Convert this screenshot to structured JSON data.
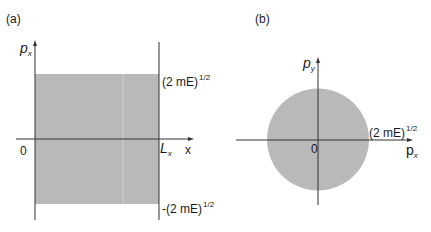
{
  "panel_a": {
    "label": "(a)",
    "y_axis": {
      "symbol": "p",
      "subscript": "x"
    },
    "x_axis": {
      "symbol": "x"
    },
    "origin": "0",
    "right_boundary": {
      "symbol": "L",
      "subscript": "x"
    },
    "upper_limit": {
      "text": "(2 mE)",
      "exponent": "1/2"
    },
    "lower_limit": {
      "text": "-(2 mE)",
      "exponent": "1/2"
    },
    "fill_color": "#b9b9b9",
    "axis_color": "#333333"
  },
  "panel_b": {
    "label": "(b)",
    "y_axis": {
      "symbol": "p",
      "subscript": "y"
    },
    "x_axis": {
      "symbol": "p",
      "subscript": "x"
    },
    "origin": "0",
    "radius_label": {
      "text": "(2 mE)",
      "exponent": "1/2"
    },
    "fill_color": "#b9b9b9",
    "axis_color": "#333333"
  }
}
